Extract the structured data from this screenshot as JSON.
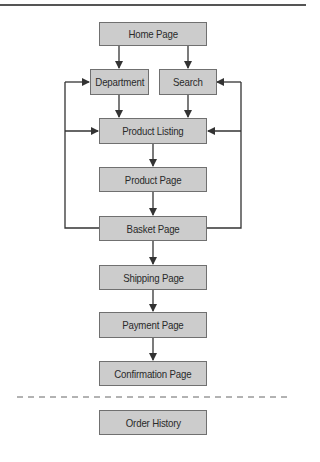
{
  "diagram": {
    "type": "site-navigation-flow",
    "nodes": [
      {
        "id": "home",
        "label": "Home Page"
      },
      {
        "id": "department",
        "label": "Department"
      },
      {
        "id": "search",
        "label": "Search"
      },
      {
        "id": "listing",
        "label": "Product Listing"
      },
      {
        "id": "product",
        "label": "Product Page"
      },
      {
        "id": "basket",
        "label": "Basket Page"
      },
      {
        "id": "shipping",
        "label": "Shipping Page"
      },
      {
        "id": "payment",
        "label": "Payment Page"
      },
      {
        "id": "confirmation",
        "label": "Confirmation Page"
      },
      {
        "id": "history",
        "label": "Order History"
      }
    ],
    "edges": [
      {
        "from": "home",
        "to": "department"
      },
      {
        "from": "home",
        "to": "search"
      },
      {
        "from": "department",
        "to": "listing"
      },
      {
        "from": "search",
        "to": "listing"
      },
      {
        "from": "listing",
        "to": "product"
      },
      {
        "from": "product",
        "to": "basket"
      },
      {
        "from": "basket",
        "to": "department"
      },
      {
        "from": "basket",
        "to": "listing"
      },
      {
        "from": "basket",
        "to": "search"
      },
      {
        "from": "basket",
        "to": "shipping"
      },
      {
        "from": "shipping",
        "to": "payment"
      },
      {
        "from": "payment",
        "to": "confirmation"
      }
    ],
    "separator": "dashed"
  },
  "colors": {
    "box_fill": "#cccccc",
    "box_border": "#707070",
    "line": "#333333"
  }
}
